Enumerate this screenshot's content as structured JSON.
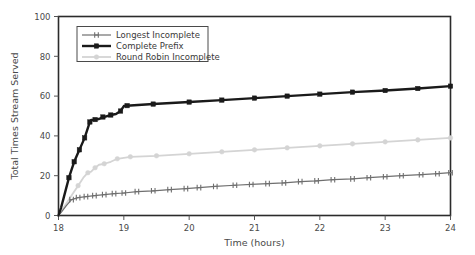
{
  "chart_data": {
    "type": "line",
    "title": "",
    "xlabel": "Time (hours)",
    "ylabel": "Total Times Stream Served",
    "xlim": [
      18,
      24
    ],
    "ylim": [
      0,
      100
    ],
    "xticks": [
      18,
      19,
      20,
      21,
      22,
      23,
      24
    ],
    "xticklabels": [
      "18",
      "19",
      "20",
      "21",
      "22",
      "23",
      "24"
    ],
    "yticks": [
      0,
      20,
      40,
      60,
      80,
      100
    ],
    "yticklabels": [
      "0",
      "20",
      "40",
      "60",
      "80",
      "100"
    ],
    "grid": false,
    "legend_position": "upper left",
    "series": [
      {
        "name": "Longest Incomplete",
        "color": "#6f6f6f",
        "marker": "tick",
        "linewidth": 1.2,
        "x": [
          18.0,
          18.05,
          18.12,
          18.2,
          18.3,
          18.42,
          18.55,
          18.7,
          18.85,
          19.0,
          19.2,
          19.45,
          19.7,
          19.95,
          20.15,
          20.4,
          20.7,
          20.95,
          21.2,
          21.45,
          21.7,
          21.95,
          22.2,
          22.5,
          22.75,
          23.0,
          23.25,
          23.55,
          23.8,
          24.0
        ],
        "y": [
          0.0,
          2.0,
          5.0,
          8.0,
          9.0,
          9.5,
          10.0,
          10.5,
          11.0,
          11.3,
          12.0,
          12.4,
          13.0,
          13.5,
          14.0,
          14.6,
          15.2,
          15.6,
          16.0,
          16.4,
          17.0,
          17.4,
          18.0,
          18.4,
          19.0,
          19.5,
          20.0,
          20.5,
          21.0,
          21.5
        ]
      },
      {
        "name": "Complete Prefix",
        "color": "#1a1a1a",
        "marker": "square",
        "linewidth": 2.4,
        "x": [
          18.0,
          18.04,
          18.08,
          18.12,
          18.16,
          18.2,
          18.24,
          18.28,
          18.32,
          18.36,
          18.4,
          18.44,
          18.48,
          18.5,
          18.56,
          18.62,
          18.68,
          18.72,
          18.8,
          18.88,
          18.95,
          19.0,
          19.05,
          19.1,
          19.45,
          20.0,
          20.5,
          21.0,
          21.5,
          22.0,
          22.5,
          23.0,
          23.5,
          24.0
        ],
        "y": [
          0.0,
          4.0,
          9.0,
          14.0,
          19.0,
          23.0,
          27.0,
          30.0,
          33.0,
          36.0,
          39.0,
          43.0,
          47.0,
          48.0,
          48.2,
          48.5,
          49.5,
          49.7,
          50.5,
          51.0,
          52.5,
          55.0,
          55.2,
          55.3,
          56.0,
          57.0,
          58.0,
          59.0,
          60.0,
          61.0,
          62.0,
          62.8,
          63.8,
          65.0
        ]
      },
      {
        "name": "Round Robin Incomplete",
        "color": "#d4d4d4",
        "marker": "circle",
        "linewidth": 1.8,
        "x": [
          18.0,
          18.06,
          18.14,
          18.22,
          18.3,
          18.38,
          18.45,
          18.5,
          18.56,
          18.62,
          18.7,
          18.8,
          18.9,
          19.0,
          19.1,
          19.5,
          20.0,
          20.5,
          21.0,
          21.5,
          22.0,
          22.5,
          23.0,
          23.5,
          24.0
        ],
        "y": [
          0.0,
          3.0,
          7.0,
          11.0,
          15.0,
          19.0,
          21.5,
          22.0,
          24.0,
          25.5,
          26.0,
          27.0,
          28.5,
          29.0,
          29.5,
          30.0,
          31.0,
          32.0,
          33.0,
          34.0,
          35.0,
          36.0,
          37.0,
          38.0,
          39.0
        ]
      }
    ]
  }
}
